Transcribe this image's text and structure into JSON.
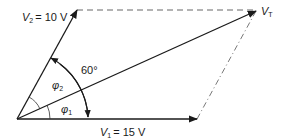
{
  "diagram": {
    "type": "phasor-diagram",
    "colors": {
      "line": "#1a1a1a",
      "dashed": "#555555",
      "background": "#ffffff"
    },
    "vectors": [
      {
        "id": "V1",
        "symbol": "V",
        "subscript": "1",
        "value": "= 15 V"
      },
      {
        "id": "V2",
        "symbol": "V",
        "subscript": "2",
        "value": "= 10 V"
      },
      {
        "id": "VT",
        "symbol": "V",
        "subscript": "T",
        "value": ""
      }
    ],
    "angles": {
      "between_V1_V2": "60°",
      "phi1": {
        "symbol": "φ",
        "subscript": "1"
      },
      "phi2": {
        "symbol": "φ",
        "subscript": "2"
      }
    }
  }
}
